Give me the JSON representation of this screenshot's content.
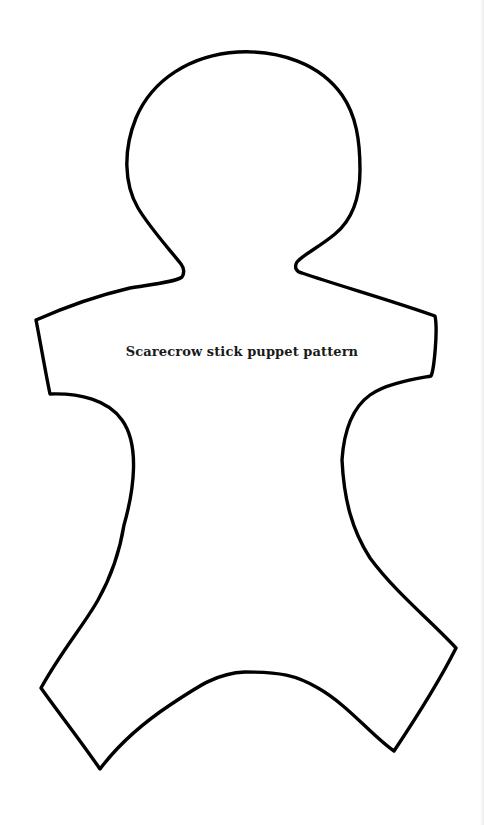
{
  "document": {
    "caption": "Scarecrow stick puppet pattern",
    "figure": "puppet-outline",
    "colors": {
      "background": "#ffffff",
      "outline": "#000000",
      "text": "#1a1a1a"
    }
  }
}
